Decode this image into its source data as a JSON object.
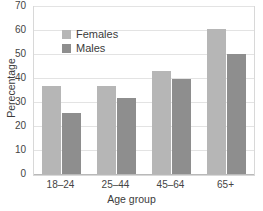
{
  "chart_data": {
    "type": "bar",
    "title": "",
    "xlabel": "Age group",
    "ylabel": "Perecentage",
    "categories": [
      "18–24",
      "25–44",
      "45–64",
      "65+"
    ],
    "series": [
      {
        "name": "Females",
        "color": "#b6b6b6",
        "values": [
          37,
          37,
          43.5,
          61
        ]
      },
      {
        "name": "Males",
        "color": "#8e8e8e",
        "values": [
          26,
          32,
          40,
          50.5
        ]
      }
    ],
    "ylim": [
      0,
      70
    ],
    "yticks": [
      0,
      10,
      20,
      30,
      40,
      50,
      60,
      70
    ],
    "ytick_labels": [
      "0",
      "10",
      "20",
      "30",
      "40",
      "50",
      "60",
      "70"
    ],
    "grid": true,
    "legend_position": "upper-left-inside"
  },
  "legend": {
    "items": [
      {
        "label": "Females"
      },
      {
        "label": "Males"
      }
    ]
  },
  "axes": {
    "x_title": "Age group",
    "y_title": "Perecentage"
  }
}
